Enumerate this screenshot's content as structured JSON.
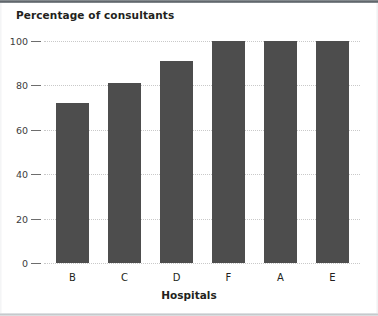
{
  "frame": {
    "top_border_color": "#5d6368",
    "bottom_border_color": "#c2c6c9",
    "background": "#ffffff"
  },
  "chart_data": {
    "type": "bar",
    "title": "Percentage of consultants",
    "xlabel": "Hospitals",
    "ylabel": "",
    "categories": [
      "B",
      "C",
      "D",
      "F",
      "A",
      "E"
    ],
    "values": [
      72,
      81,
      91,
      100,
      100,
      100
    ],
    "ylim": [
      0,
      100
    ],
    "yticks": [
      0,
      20,
      40,
      60,
      80,
      100
    ],
    "ytick_labels": [
      "0",
      "20",
      "40",
      "60",
      "80",
      "100"
    ],
    "grid": true,
    "grid_style": "dotted",
    "grid_color": "#c9c9c9",
    "legend": null,
    "bar_color": "#4d4d4d",
    "axis_text_color": "#231f20"
  }
}
